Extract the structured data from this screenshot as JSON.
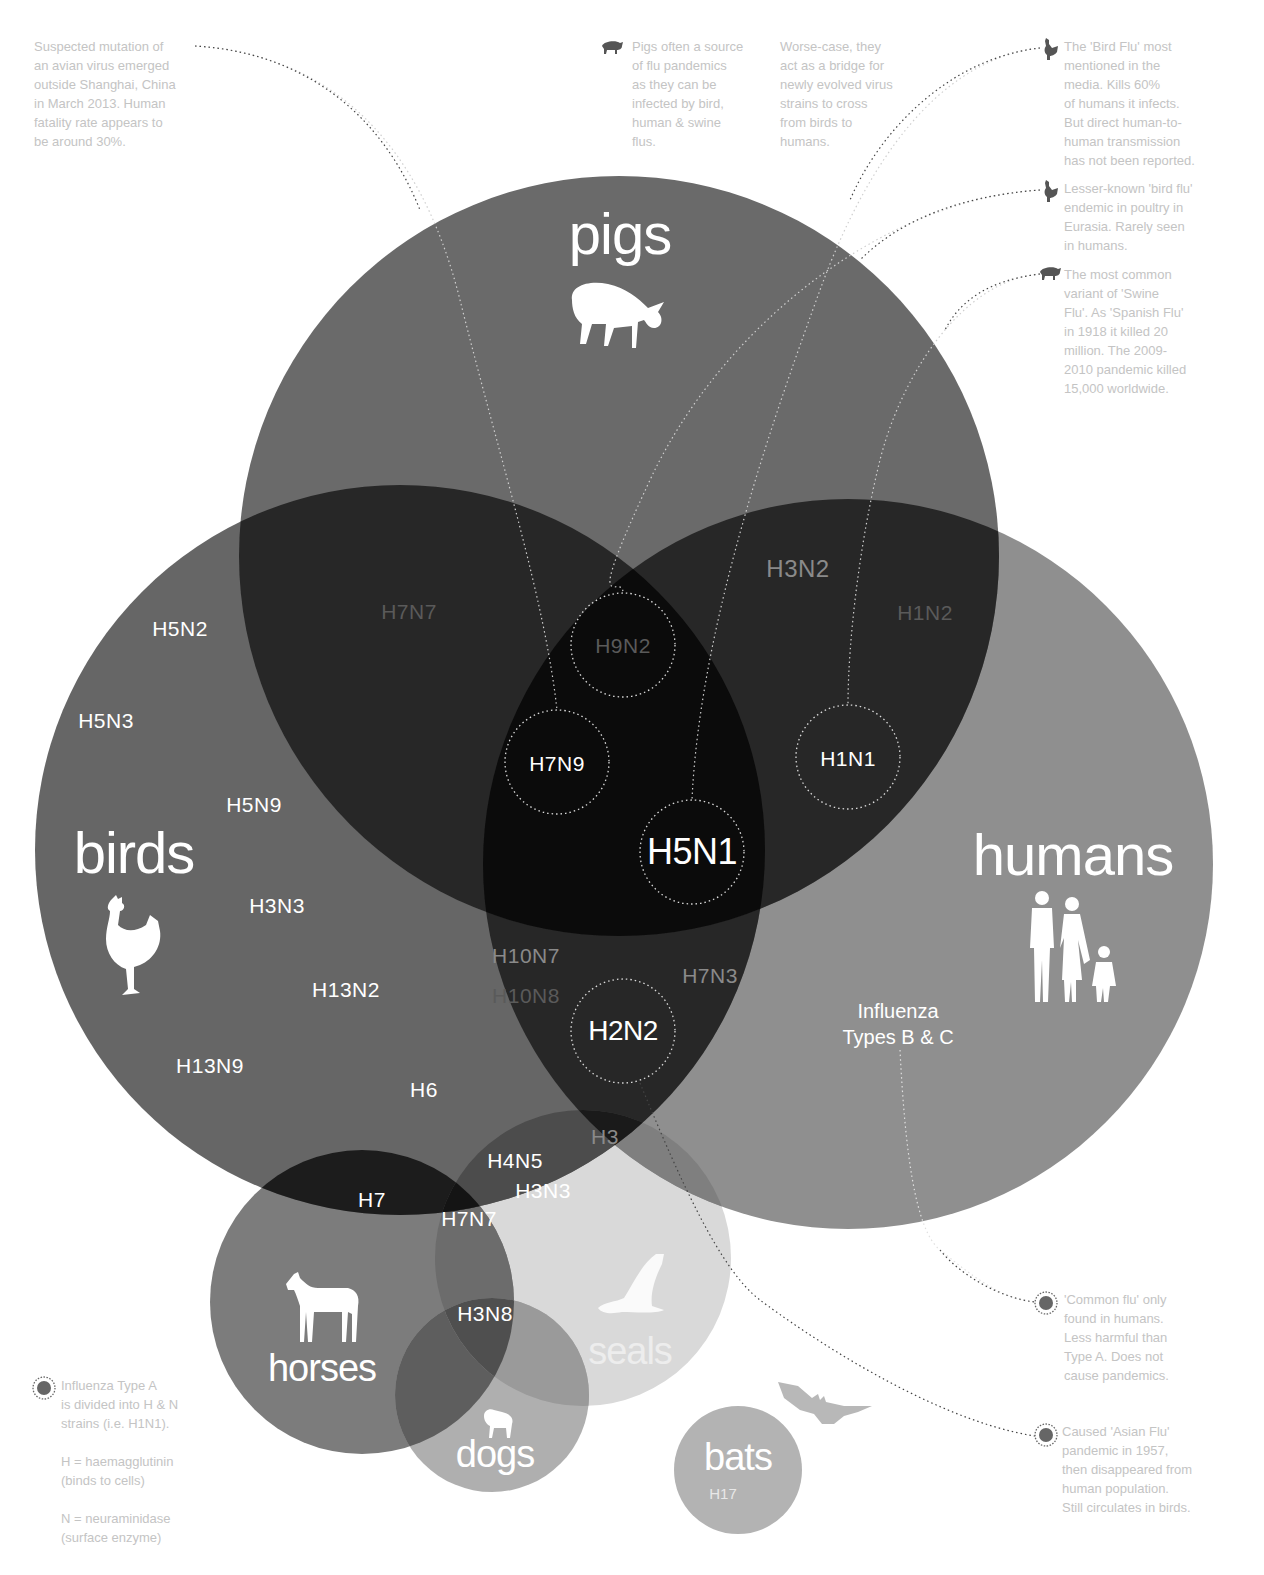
{
  "diagram": {
    "type": "venn",
    "colors": {
      "single_pigs": "#6a6a6a",
      "single_birds": "#666666",
      "single_humans": "#8f8f8f",
      "pair_overlap": "#272727",
      "triple_overlap": "#0b0b0b",
      "horses": "#7c7c7c",
      "seals": "#d9d9d9",
      "dogs": "#a6a6a6",
      "bats": "#b3b3b3",
      "note_text": "#c4c4c4"
    },
    "groups": {
      "pigs": "pigs",
      "birds": "birds",
      "humans": "humans",
      "horses": "horses",
      "seals": "seals",
      "dogs": "dogs",
      "bats": "bats"
    },
    "bats_strain": "H17",
    "influenza_bc": "Influenza\nTypes B & C",
    "strains": {
      "birds_only": [
        "H5N2",
        "H5N3",
        "H5N9",
        "H3N3",
        "H13N2",
        "H13N9",
        "H6"
      ],
      "birds_pigs": [
        "H7N7"
      ],
      "pigs_humans": [
        "H3N2",
        "H1N2"
      ],
      "birds_humans": [
        "H10N7",
        "H10N8",
        "H7N3",
        "H3"
      ],
      "all_three": [
        "H9N2",
        "H7N9",
        "H5N1"
      ],
      "circled": [
        "H9N2",
        "H7N9",
        "H1N1",
        "H5N1",
        "H2N2"
      ],
      "birds_horses": [
        "H7"
      ],
      "birds_horses_seals": [
        "H7N7"
      ],
      "birds_seals": [
        "H4N5",
        "H3N3"
      ],
      "horses_dogs": [
        "H3N8"
      ],
      "humans_birds_pigs_circle": [
        "H1N1"
      ],
      "birds_humans_circle": [
        "H2N2"
      ]
    }
  },
  "notes": {
    "h7n9": "Suspected mutation of\nan avian virus emerged\noutside Shanghai, China\nin March 2013. Human\nfatality rate appears to\nbe around 30%.",
    "pigs_source": "Pigs often a source\nof flu pandemics\nas they can be\ninfected by bird,\nhuman & swine\nflus.",
    "pigs_bridge": "Worse-case, they\nact as a bridge for\nnewly evolved virus\nstrains to cross\nfrom birds to\nhumans.",
    "h5n1": "The 'Bird Flu' most\nmentioned in the\nmedia. Kills 60%\nof humans it infects.\nBut direct human-to-\nhuman transmission\nhas not been reported.",
    "h9n2": "Lesser-known 'bird flu'\nendemic in poultry in\nEurasia. Rarely seen\nin humans.",
    "h1n1": "The most common\nvariant of 'Swine\nFlu'. As 'Spanish Flu'\nin 1918 it killed 20\nmillion. The 2009-\n2010 pandemic killed\n15,000 worldwide.",
    "common_flu": "'Common flu' only\nfound in humans.\nLess harmful than\nType A. Does not\ncause pandemics.",
    "h2n2": "Caused 'Asian Flu'\npandemic in 1957,\nthen disappeared from\nhuman population.\nStill circulates in birds.",
    "legend": "Influenza Type A\nis divided into H & N\nstrains (i.e. H1N1).\n\nH = haemagglutinin\n(binds to cells)\n\nN = neuraminidase\n(surface enzyme)"
  },
  "icons": {
    "pig": "pig-icon",
    "rooster": "rooster-icon",
    "humans": "family-icon",
    "horse": "horse-icon",
    "seal": "seal-icon",
    "dog": "dog-icon",
    "bat": "bat-icon",
    "virus": "virus-icon"
  }
}
